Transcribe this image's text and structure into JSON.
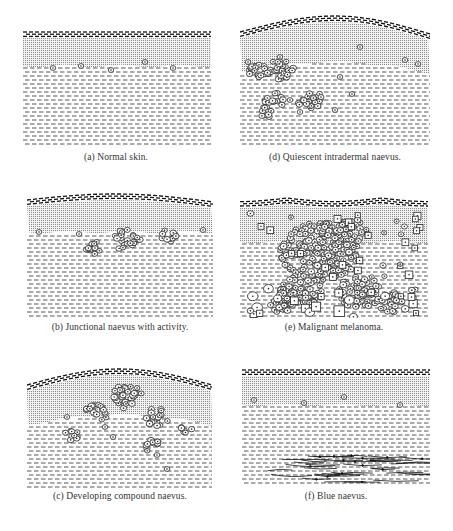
{
  "figure": {
    "background": "#ffffff",
    "ink_color": "#1a1a1a",
    "epidermis_fill": "#c8c8c8",
    "panels": [
      {
        "id": "a",
        "caption": "(a) Normal skin.",
        "box": [
          23,
          28,
          188,
          120
        ],
        "caption_xy": [
          116,
          158
        ],
        "surface": "flat",
        "surface_y": [
          4,
          4,
          4
        ],
        "junction_y": 38,
        "cells": [
          [
            30,
            40
          ],
          [
            58,
            38
          ],
          [
            88,
            42
          ],
          [
            122,
            34
          ],
          [
            150,
            40
          ]
        ],
        "clusters": [],
        "fibres": false
      },
      {
        "id": "d",
        "caption": "(d) Quiescent intradermal naevus.",
        "box": [
          240,
          12,
          190,
          136
        ],
        "caption_xy": [
          335,
          158
        ],
        "surface": "hump",
        "surface_y": [
          20,
          4,
          22
        ],
        "junction_y": 50,
        "cells": [
          [
            8,
            50
          ],
          [
            40,
            45
          ],
          [
            120,
            35
          ],
          [
            178,
            52
          ],
          [
            165,
            48
          ],
          [
            50,
            88
          ],
          [
            60,
            100
          ],
          [
            100,
            65
          ],
          [
            112,
            82
          ],
          [
            95,
            98
          ],
          [
            78,
            94
          ]
        ],
        "clusters": [
          [
            18,
            58,
            12
          ],
          [
            40,
            58,
            14
          ],
          [
            35,
            88,
            10
          ],
          [
            70,
            88,
            13
          ],
          [
            25,
            100,
            8
          ]
        ],
        "fibres": false
      },
      {
        "id": "b",
        "caption": "(b) Junctional naevus with activity.",
        "box": [
          27,
          192,
          186,
          125
        ],
        "caption_xy": [
          120,
          328
        ],
        "surface": "flat",
        "surface_y": [
          8,
          2,
          10
        ],
        "junction_y": 40,
        "cells": [
          [
            12,
            40
          ],
          [
            52,
            42
          ],
          [
            176,
            38
          ]
        ],
        "clusters": [
          [
            100,
            48,
            14
          ],
          [
            68,
            56,
            10
          ],
          [
            140,
            44,
            9
          ]
        ],
        "fibres": false
      },
      {
        "id": "e",
        "caption": "(e) Malignant melanoma.",
        "box": [
          240,
          192,
          188,
          126
        ],
        "caption_xy": [
          334,
          328
        ],
        "surface": "dip",
        "surface_y": [
          10,
          4,
          8
        ],
        "junction_y": 50,
        "cells": [],
        "clusters": [
          [
            80,
            60,
            40
          ],
          [
            110,
            40,
            18
          ],
          [
            60,
            100,
            22
          ],
          [
            120,
            100,
            22
          ],
          [
            40,
            110,
            14
          ],
          [
            150,
            110,
            14
          ]
        ],
        "fibres": false,
        "malignant": true
      },
      {
        "id": "c",
        "caption": "(c) Developing compound naevus.",
        "box": [
          27,
          367,
          185,
          123
        ],
        "caption_xy": [
          120,
          497
        ],
        "surface": "hump",
        "surface_y": [
          18,
          2,
          18
        ],
        "junction_y": 48,
        "cells": [
          [
            40,
            50
          ],
          [
            78,
            60
          ],
          [
            86,
            70
          ],
          [
            130,
            88
          ],
          [
            140,
            102
          ]
        ],
        "clusters": [
          [
            100,
            30,
            16
          ],
          [
            70,
            45,
            12
          ],
          [
            130,
            50,
            12
          ],
          [
            160,
            62,
            7
          ],
          [
            45,
            68,
            8
          ],
          [
            125,
            80,
            10
          ]
        ],
        "fibres": false
      },
      {
        "id": "f",
        "caption": "(f) Blue naevus.",
        "box": [
          242,
          367,
          188,
          120
        ],
        "caption_xy": [
          336,
          497
        ],
        "surface": "flat",
        "surface_y": [
          3,
          3,
          3
        ],
        "junction_y": 38,
        "cells": [
          [
            12,
            33
          ],
          [
            62,
            36
          ],
          [
            102,
            30
          ],
          [
            158,
            38
          ]
        ],
        "clusters": [],
        "fibres": true
      }
    ]
  }
}
